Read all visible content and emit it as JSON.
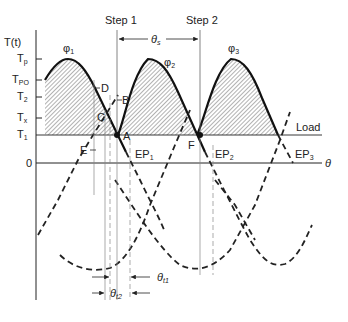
{
  "diagram": {
    "y_axis": {
      "label": "T(t)",
      "ticks": [
        {
          "id": "Tp",
          "main": "T",
          "sub": "p"
        },
        {
          "id": "TPO",
          "main": "T",
          "sub": "PO"
        },
        {
          "id": "T2",
          "main": "T",
          "sub": "2"
        },
        {
          "id": "Tx",
          "main": "T",
          "sub": "x"
        },
        {
          "id": "T1",
          "main": "T",
          "sub": "1"
        },
        {
          "id": "zero",
          "main": "0",
          "sub": ""
        }
      ]
    },
    "x_axis": {
      "label": "θ"
    },
    "steps": [
      {
        "id": "step1",
        "label": "Step 1"
      },
      {
        "id": "step2",
        "label": "Step 2"
      }
    ],
    "step_angle": {
      "main": "θ",
      "sub": "s"
    },
    "phases": [
      {
        "id": "phi1",
        "main": "φ",
        "sub": "1"
      },
      {
        "id": "phi2",
        "main": "φ",
        "sub": "2"
      },
      {
        "id": "phi3",
        "main": "φ",
        "sub": "3"
      }
    ],
    "points": {
      "A": "A",
      "B": "B",
      "C": "C",
      "D": "D",
      "E": "E",
      "F": "F"
    },
    "equilibrium_points": [
      {
        "id": "EP1",
        "main": "EP",
        "sub": "1"
      },
      {
        "id": "EP2",
        "main": "EP",
        "sub": "2"
      },
      {
        "id": "EP3",
        "main": "EP",
        "sub": "3"
      }
    ],
    "load_label": "Load",
    "theta_t1": {
      "main": "θ",
      "sub": "t1"
    },
    "theta_t2": {
      "main": "θ",
      "sub": "t2"
    },
    "colors": {
      "line": "#1a1a1a",
      "hatch": "#555555",
      "guide": "#888888"
    }
  }
}
